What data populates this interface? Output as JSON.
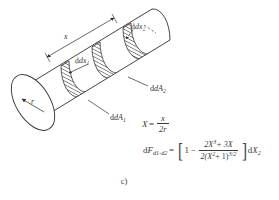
{
  "figure": {
    "caption": "c)",
    "colors": {
      "ink": "#333333",
      "ink_soft": "#4a4a4a",
      "background": "#ffffff",
      "hatch": "#2f2f2f"
    }
  },
  "diagram": {
    "labels": {
      "length_x": "x",
      "radius_r": "r",
      "strip1": "dx",
      "strip1_sub": "1",
      "strip2": "dx",
      "strip2_sub": "2",
      "area1": "dA",
      "area1_sub": "1",
      "area2": "dA",
      "area2_sub": "2"
    }
  },
  "equations": {
    "eq1": {
      "lhs": "X",
      "equals": "=",
      "numerator": "x",
      "denominator": "2r"
    },
    "eq2": {
      "lhs": "dF",
      "lhs_sub_a": "d1",
      "lhs_sub_b": "d2",
      "lhs_sub_dash": "-",
      "equals": "=",
      "bracket_left": "[",
      "bracket_right": "]",
      "one": "1",
      "minus": "−",
      "numerator": "2X",
      "numerator_exp": "3",
      "numerator_plus": "+ 3X",
      "denominator_a": "2(X",
      "denominator_exp_a": "2",
      "denominator_b": "+ 1)",
      "denominator_exp_b": "3/2",
      "trailing": "dX",
      "trailing_sub": "2"
    }
  }
}
